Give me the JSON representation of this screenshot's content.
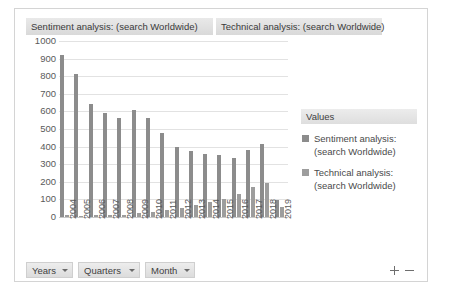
{
  "window": {
    "title_chips": [
      "Sentiment analysis: (search  Worldwide)",
      "Technical analysis: (search  Worldwide)"
    ]
  },
  "legend": {
    "header": "Values",
    "items": [
      "Sentiment analysis: (search Worldwide)",
      "Technical analysis: (search Worldwide)"
    ]
  },
  "toolbar": {
    "buttons": [
      "Years",
      "Quarters",
      "Month"
    ]
  },
  "zoom_controls": {
    "zoom_in": "+",
    "zoom_out": "−"
  },
  "colors": {
    "series1": "#8c8c8c",
    "series2": "#9d9d9d",
    "grid": "#e2e2e2",
    "chip": "#dedede"
  },
  "chart_data": {
    "type": "bar",
    "xlabel": "",
    "ylabel": "",
    "ylim": [
      0,
      1000
    ],
    "yticks": [
      0,
      100,
      200,
      300,
      400,
      500,
      600,
      700,
      800,
      900,
      1000
    ],
    "ytick_labels": [
      "0",
      "100",
      "200",
      "300",
      "400",
      "500",
      "600",
      "700",
      "800",
      "900",
      "1000"
    ],
    "grid": true,
    "legend_position": "right",
    "categories": [
      "2004",
      "2005",
      "2006",
      "2007",
      "2008",
      "2009",
      "2010",
      "2011",
      "2012",
      "2013",
      "2014",
      "2015",
      "2016",
      "2017",
      "2018",
      "2019"
    ],
    "series": [
      {
        "name": "Sentiment analysis: (search Worldwide)",
        "values": [
          920,
          810,
          640,
          590,
          560,
          610,
          565,
          480,
          400,
          375,
          360,
          350,
          335,
          380,
          415,
          95
        ]
      },
      {
        "name": "Technical analysis: (search Worldwide)",
        "values": [
          10,
          8,
          12,
          14,
          12,
          22,
          28,
          42,
          52,
          68,
          85,
          100,
          128,
          172,
          195,
          55
        ]
      }
    ]
  }
}
